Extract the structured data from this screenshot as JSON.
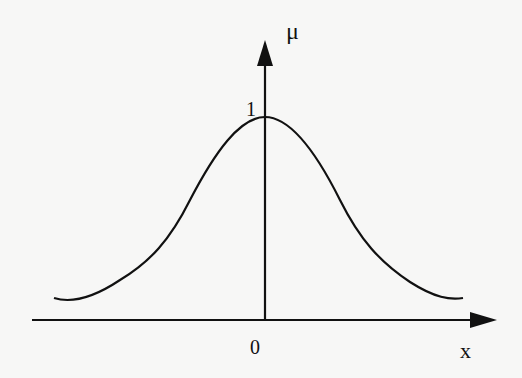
{
  "diagram": {
    "type": "gaussian-membership-function",
    "y_axis_label": "μ",
    "x_axis_label": "x",
    "origin_label": "0",
    "peak_label": "1",
    "line_color": "#111111",
    "background": "#f7f7f6"
  }
}
